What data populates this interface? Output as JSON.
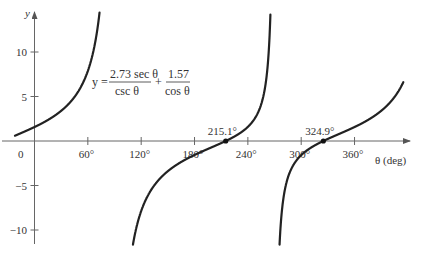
{
  "chart_data": {
    "type": "line",
    "title": "",
    "equation": {
      "lhs": "y =",
      "term1_num": "2.73 sec θ",
      "term1_den": "csc θ",
      "plus": "+",
      "term2_num": "1.57",
      "term2_den": "cos θ"
    },
    "function": {
      "a": 2.73,
      "b": 1.57,
      "form": "y = a·tanθ + b·secθ"
    },
    "xlabel": "θ (deg)",
    "ylabel": "y",
    "x_ticks": [
      {
        "value": 0,
        "label": "0"
      },
      {
        "value": 60,
        "label": "60°"
      },
      {
        "value": 120,
        "label": "120°"
      },
      {
        "value": 180,
        "label": "180°"
      },
      {
        "value": 240,
        "label": "240°"
      },
      {
        "value": 300,
        "label": "300°"
      },
      {
        "value": 360,
        "label": "360°"
      }
    ],
    "y_ticks": [
      {
        "value": 10,
        "label": "10"
      },
      {
        "value": 5,
        "label": "5"
      },
      {
        "value": -5,
        "label": "−5"
      },
      {
        "value": -10,
        "label": "−10"
      }
    ],
    "xlim": [
      -22,
      415
    ],
    "ylim": [
      -11.5,
      14
    ],
    "grid": false,
    "asymptotes": [
      90,
      270
    ],
    "series": [
      {
        "name": "branch-1",
        "x_range": [
          -22,
          90
        ]
      },
      {
        "name": "branch-2",
        "x_range": [
          90,
          270
        ]
      },
      {
        "name": "branch-3",
        "x_range": [
          270,
          415
        ]
      }
    ],
    "roots": [
      {
        "x": 215.1,
        "label": "215.1°"
      },
      {
        "x": 324.9,
        "label": "324.9°"
      }
    ],
    "line_color": "#222222",
    "axis_color": "#666666"
  }
}
